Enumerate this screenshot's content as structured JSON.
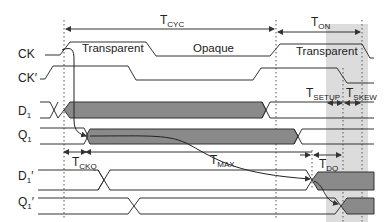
{
  "diagram": {
    "type": "timing-diagram",
    "colors": {
      "line": "#333333",
      "fill": "#8a8a8a",
      "shade": "#dcdcdc",
      "text": "#222222"
    },
    "signals": [
      {
        "id": "CK",
        "main": "CK",
        "sub": "",
        "prime": ""
      },
      {
        "id": "CKp",
        "main": "CK",
        "sub": "",
        "prime": "′"
      },
      {
        "id": "D1",
        "main": "D",
        "sub": "1",
        "prime": ""
      },
      {
        "id": "Q1",
        "main": "Q",
        "sub": "1",
        "prime": ""
      },
      {
        "id": "D1p",
        "main": "D",
        "sub": "1",
        "prime": "′"
      },
      {
        "id": "Q1p",
        "main": "Q",
        "sub": "1",
        "prime": "′"
      }
    ],
    "phases": [
      {
        "label": "Transparent"
      },
      {
        "label": "Opaque"
      },
      {
        "label": "Transparent"
      }
    ],
    "timings": {
      "tcyc": {
        "main": "T",
        "sub": "CYC"
      },
      "ton": {
        "main": "T",
        "sub": "ON"
      },
      "tsetup": {
        "main": "T",
        "sub": "SETUP"
      },
      "tskew": {
        "main": "T",
        "sub": "SKEW"
      },
      "tckq": {
        "main": "T",
        "sub": "CKQ"
      },
      "tmax": {
        "main": "T",
        "sub": "MAX"
      },
      "tdq": {
        "main": "T",
        "sub": "DQ"
      }
    }
  }
}
